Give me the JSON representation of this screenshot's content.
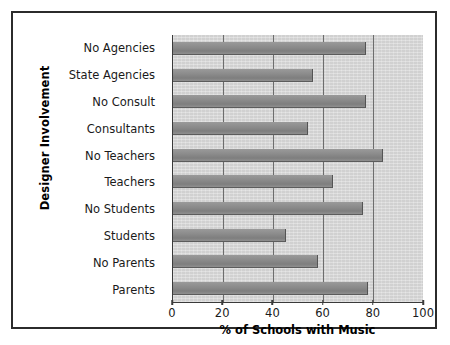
{
  "chart_data": {
    "type": "bar",
    "orientation": "horizontal",
    "title": "",
    "xlabel": "% of Schools with Music",
    "ylabel": "Designer Involvement",
    "categories": [
      "No Agencies",
      "State Agencies",
      "No Consult",
      "Consultants",
      "No Teachers",
      "Teachers",
      "No Students",
      "Students",
      "No Parents",
      "Parents"
    ],
    "values": [
      77,
      56,
      77,
      54,
      84,
      64,
      76,
      45,
      58,
      78
    ],
    "xlim": [
      0,
      100
    ],
    "xticks": [
      0,
      20,
      40,
      60,
      80,
      100
    ],
    "xtick_labels": [
      "0",
      "20",
      "40",
      "60",
      "80",
      "100"
    ],
    "grid": "vertical",
    "legend": "none",
    "bar_color": "#8a8a8a",
    "plot_background": "#d6d6d6",
    "axis_color": "#3a3a3a",
    "gridline_color": "#6d6d6d",
    "frame_color": "#2b2b2b"
  }
}
